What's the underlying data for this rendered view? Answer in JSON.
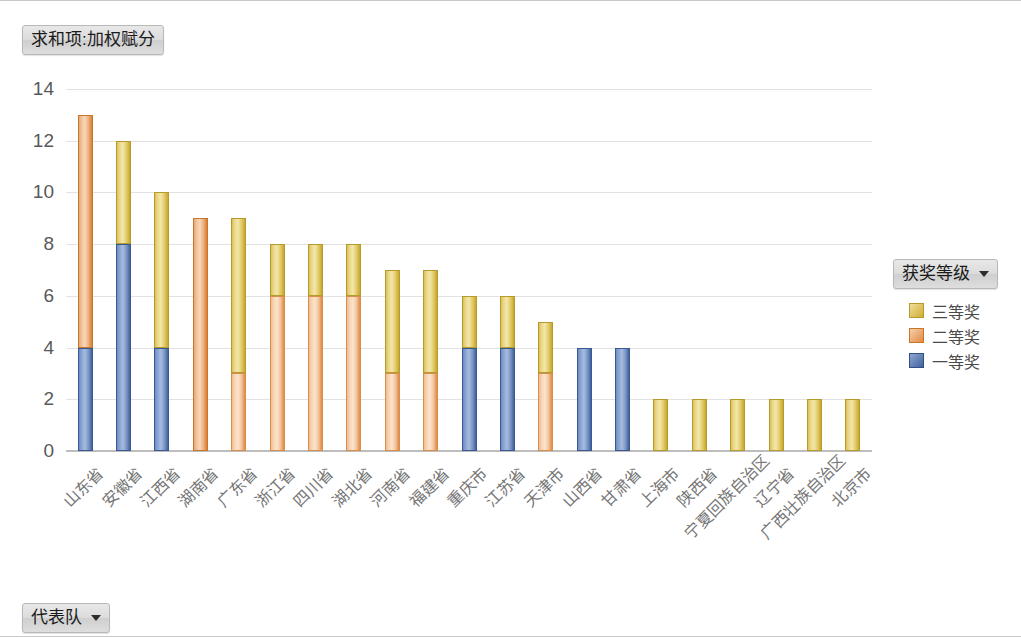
{
  "value_field_button": {
    "label": "求和项:加权赋分",
    "has_caret": false
  },
  "category_field_button": {
    "label": "代表队",
    "has_caret": true
  },
  "legend": {
    "title": "获奖等级",
    "has_caret": true,
    "entries": [
      {
        "label": "三等奖",
        "color": "#e3cc6b"
      },
      {
        "label": "二等奖",
        "color": "#f2b183"
      },
      {
        "label": "一等奖",
        "color": "#4a6aa5"
      }
    ]
  },
  "chart_data": {
    "type": "bar",
    "stacked": true,
    "title": "求和项:加权赋分",
    "xlabel": "代表队",
    "ylabel": "",
    "ylim": [
      0,
      14
    ],
    "yticks": [
      0,
      2,
      4,
      6,
      8,
      10,
      12,
      14
    ],
    "grid": true,
    "legend_position": "right",
    "legend_title": "获奖等级",
    "categories": [
      "山东省",
      "安徽省",
      "江西省",
      "湖南省",
      "广东省",
      "浙江省",
      "四川省",
      "湖北省",
      "河南省",
      "福建省",
      "重庆市",
      "江苏省",
      "天津市",
      "山西省",
      "甘肃省",
      "上海市",
      "陕西省",
      "宁夏回族自治区",
      "辽宁省",
      "广西壮族自治区",
      "北京市"
    ],
    "series": [
      {
        "name": "一等奖",
        "color": "#4a6aa5",
        "values": [
          4,
          8,
          4,
          0,
          0,
          0,
          0,
          0,
          0,
          0,
          4,
          4,
          0,
          4,
          4,
          0,
          0,
          0,
          0,
          0,
          0
        ]
      },
      {
        "name": "二等奖",
        "color": "#f2b183",
        "values": [
          9,
          0,
          0,
          9,
          3,
          6,
          6,
          6,
          3,
          3,
          0,
          0,
          3,
          0,
          0,
          0,
          0,
          0,
          0,
          0,
          0
        ]
      },
      {
        "name": "三等奖",
        "color": "#e3cc6b",
        "values": [
          0,
          4,
          6,
          0,
          6,
          2,
          2,
          2,
          4,
          4,
          2,
          2,
          2,
          0,
          0,
          2,
          2,
          2,
          2,
          2,
          2
        ]
      }
    ],
    "totals": [
      13,
      12,
      10,
      9,
      9,
      8,
      8,
      8,
      7,
      7,
      6,
      6,
      5,
      4,
      4,
      2,
      2,
      2,
      2,
      2,
      2
    ]
  }
}
